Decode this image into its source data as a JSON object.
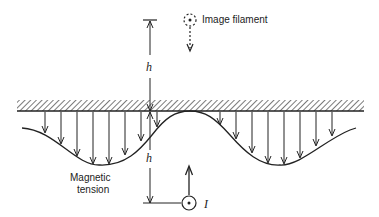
{
  "diagram": {
    "title": "",
    "labels": {
      "image_filament": "Image filament",
      "height_top": "h",
      "height_bottom": "h",
      "magnetic_tension_line1": "Magnetic",
      "magnetic_tension_line2": "tension",
      "current": "I"
    },
    "colors": {
      "stroke": "#222222",
      "background": "#ffffff"
    }
  }
}
